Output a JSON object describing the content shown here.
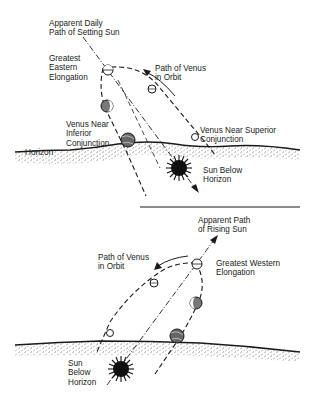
{
  "top_panel": {
    "title": "Venus as Evening Star",
    "labels": {
      "sun_path": "Apparent Daily\nPath of Setting Sun",
      "greatest_elongation": "Greatest\nEastern\nElongation",
      "orbit_path": "Path of Venus\nin Orbit",
      "inferior_conjunction": "Venus Near\nInferior\nConjunction",
      "superior_conjunction": "Venus Near Superior\nConjunction",
      "horizon": "Horizon",
      "sun": "Sun Below\nHorizon"
    }
  },
  "bottom_panel": {
    "title": "Venus as Morning Star",
    "labels": {
      "sun_path": "Apparent Path\nof Rising Sun",
      "orbit_path": "Path of Venus\nin Orbit",
      "greatest_elongation": "Greatest Western\nElongation",
      "sun": "Sun\nBelow\nHorizon"
    }
  },
  "colors": {
    "ink": "#1a1a1a",
    "ground": "#c8c8c8",
    "background": "#ffffff"
  }
}
